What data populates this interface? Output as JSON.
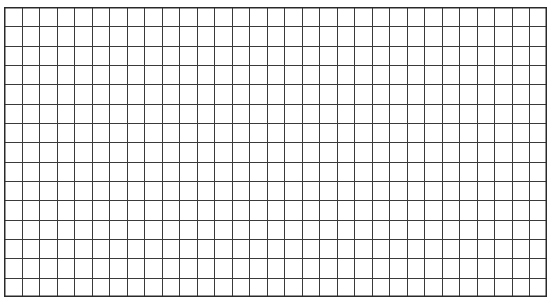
{
  "page": {
    "background": "#ffffff"
  },
  "caption": {
    "text": ""
  },
  "grid": {
    "columns": 31,
    "rows": 15,
    "left": 4,
    "top": 7,
    "width": 543,
    "height": 290,
    "line_color": "#3a3a3a",
    "line_width": 1,
    "border_color": "#2a2a2a",
    "border_width": 1.5
  }
}
